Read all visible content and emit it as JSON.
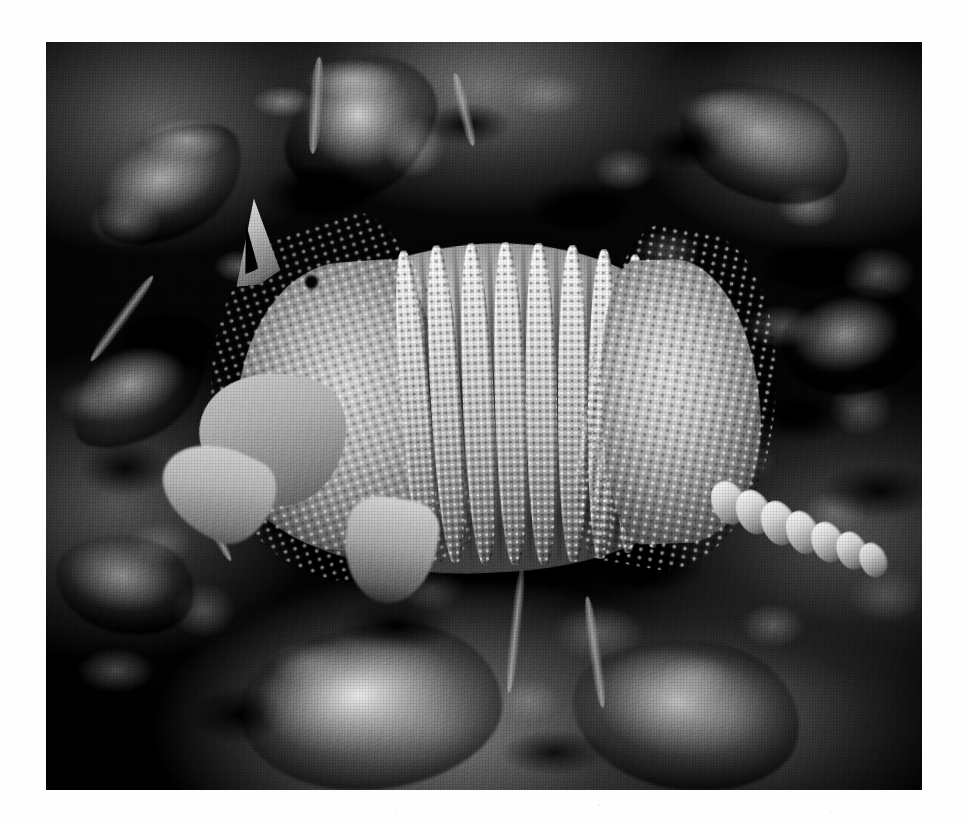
{
  "document": {
    "type": "photograph",
    "medium": "black-and-white printed photograph on white page",
    "page_background": "#ffffff"
  },
  "figure": {
    "name": "armadillo-photograph",
    "alt": "Black and white photograph of a nine-banded armadillo foraging on leaf litter",
    "scene": "forest floor covered with dry leaves and low ground plants",
    "orientation": "animal facing left, tail extending to the lower right",
    "frame": {
      "left": 46,
      "top": 42,
      "width": 876,
      "height": 748
    },
    "tone": {
      "mode": "grayscale",
      "highlight": "#f2f2f2",
      "midtone": "#9d9d9d",
      "shadow": "#101010",
      "paper": "#ffffff"
    }
  },
  "subject_parts": [
    {
      "id": "ear",
      "label": "Ear"
    },
    {
      "id": "eye",
      "label": "Eye"
    },
    {
      "id": "head",
      "label": "Head"
    },
    {
      "id": "snout",
      "label": "Snout"
    },
    {
      "id": "rump-shield",
      "label": "Pelvic shield"
    },
    {
      "id": "carapace",
      "label": "Carapace"
    },
    {
      "id": "bands",
      "label": "Movable bands"
    },
    {
      "id": "shoulder-shield",
      "label": "Scapular shield"
    },
    {
      "id": "foreleg",
      "label": "Foreleg"
    },
    {
      "id": "tail",
      "label": "Banded tail"
    }
  ],
  "carapace": {
    "band_count": 9,
    "bands": [
      {
        "left": 40.5,
        "top": 27.8,
        "width": 3.3,
        "height": 41.5,
        "rotate": -4.5
      },
      {
        "left": 44.0,
        "top": 27.2,
        "width": 3.4,
        "height": 42.5,
        "rotate": -3.5
      },
      {
        "left": 47.6,
        "top": 26.9,
        "width": 3.5,
        "height": 43.0,
        "rotate": -2.6
      },
      {
        "left": 51.2,
        "top": 26.8,
        "width": 3.5,
        "height": 43.2,
        "rotate": -1.8
      },
      {
        "left": 54.8,
        "top": 26.9,
        "width": 3.5,
        "height": 43.0,
        "rotate": -1.0
      },
      {
        "left": 58.4,
        "top": 27.2,
        "width": 3.4,
        "height": 42.4,
        "rotate": -0.2
      },
      {
        "left": 61.9,
        "top": 27.7,
        "width": 3.3,
        "height": 41.4,
        "rotate": 0.6
      },
      {
        "left": 65.3,
        "top": 28.4,
        "width": 3.1,
        "height": 40.0,
        "rotate": 1.4
      },
      {
        "left": 68.5,
        "top": 29.4,
        "width": 2.9,
        "height": 38.2,
        "rotate": 2.2
      }
    ],
    "grooves": [
      {
        "left": 43.6,
        "top": 27.4,
        "width": 0.9,
        "height": 42.0,
        "rotate": -4.0
      },
      {
        "left": 47.2,
        "top": 27.0,
        "width": 0.9,
        "height": 42.8,
        "rotate": -3.0
      },
      {
        "left": 50.8,
        "top": 26.8,
        "width": 0.9,
        "height": 43.2,
        "rotate": -2.2
      },
      {
        "left": 54.4,
        "top": 26.8,
        "width": 0.9,
        "height": 43.1,
        "rotate": -1.4
      },
      {
        "left": 58.0,
        "top": 27.0,
        "width": 0.9,
        "height": 42.6,
        "rotate": -0.6
      },
      {
        "left": 61.5,
        "top": 27.4,
        "width": 0.9,
        "height": 41.8,
        "rotate": 0.2
      },
      {
        "left": 64.9,
        "top": 28.0,
        "width": 0.9,
        "height": 40.6,
        "rotate": 1.0
      },
      {
        "left": 68.2,
        "top": 28.9,
        "width": 0.9,
        "height": 39.0,
        "rotate": 1.8
      }
    ]
  },
  "tail_segments": [
    {
      "left": 0,
      "top": 18,
      "width": 15,
      "height": 30,
      "rotate": -24
    },
    {
      "left": 11,
      "top": 24,
      "width": 15,
      "height": 31,
      "rotate": -24
    },
    {
      "left": 22,
      "top": 31,
      "width": 15,
      "height": 31,
      "rotate": -24
    },
    {
      "left": 33,
      "top": 38,
      "width": 14,
      "height": 30,
      "rotate": -24
    },
    {
      "left": 44,
      "top": 45,
      "width": 14,
      "height": 28,
      "rotate": -24
    },
    {
      "left": 55,
      "top": 52,
      "width": 13,
      "height": 26,
      "rotate": -24
    },
    {
      "left": 65,
      "top": 59,
      "width": 12,
      "height": 24,
      "rotate": -24
    }
  ],
  "leaves": [
    {
      "name": "bright-leaf-bottom-center",
      "left": 22.0,
      "top": 78.0,
      "width": 30.0,
      "height": 22.0,
      "rotate": -6,
      "tone": "#ededed",
      "shape": "lobed"
    },
    {
      "name": "bright-leaf-bottom-right",
      "left": 60.0,
      "top": 80.0,
      "width": 26.0,
      "height": 20.0,
      "rotate": 8,
      "tone": "#c9c9c9",
      "shape": "lobed"
    },
    {
      "name": "bright-leaf-top-center",
      "left": 28.0,
      "top": 1.5,
      "width": 16.0,
      "height": 20.0,
      "rotate": 14,
      "tone": "#d8d8d8",
      "shape": "blade"
    },
    {
      "name": "bright-leaf-top-left",
      "left": 5.0,
      "top": 12.0,
      "width": 18.0,
      "height": 14.0,
      "rotate": -18,
      "tone": "#b9b9b9",
      "shape": "blade"
    },
    {
      "name": "leaf-mid-left",
      "left": 2.0,
      "top": 40.0,
      "width": 17.0,
      "height": 13.0,
      "rotate": -22,
      "tone": "#a6a6a6",
      "shape": "blade"
    },
    {
      "name": "leaf-top-right",
      "left": 72.0,
      "top": 6.0,
      "width": 20.0,
      "height": 15.0,
      "rotate": 20,
      "tone": "#b2b2b2",
      "shape": "lobed"
    },
    {
      "name": "leaf-right-edge",
      "left": 84.0,
      "top": 33.0,
      "width": 16.0,
      "height": 14.0,
      "rotate": -10,
      "tone": "#9a9a9a",
      "shape": "lobed"
    },
    {
      "name": "leaf-bottom-left",
      "left": 1.0,
      "top": 66.0,
      "width": 16.0,
      "height": 13.0,
      "rotate": 12,
      "tone": "#9e9e9e",
      "shape": "lobed"
    }
  ],
  "twigs": [
    {
      "left": 30.0,
      "top": 2.0,
      "width": 1.6,
      "height": 13.0,
      "rotate": 4
    },
    {
      "left": 47.0,
      "top": 4.0,
      "width": 1.4,
      "height": 10.0,
      "rotate": -14
    },
    {
      "left": 8.0,
      "top": 30.0,
      "width": 1.4,
      "height": 14.0,
      "rotate": 36
    },
    {
      "left": 62.0,
      "top": 74.0,
      "width": 1.4,
      "height": 15.0,
      "rotate": -8
    },
    {
      "left": 53.0,
      "top": 70.0,
      "width": 1.3,
      "height": 17.0,
      "rotate": 6
    },
    {
      "left": 18.0,
      "top": 58.0,
      "width": 1.3,
      "height": 12.0,
      "rotate": -28
    }
  ]
}
